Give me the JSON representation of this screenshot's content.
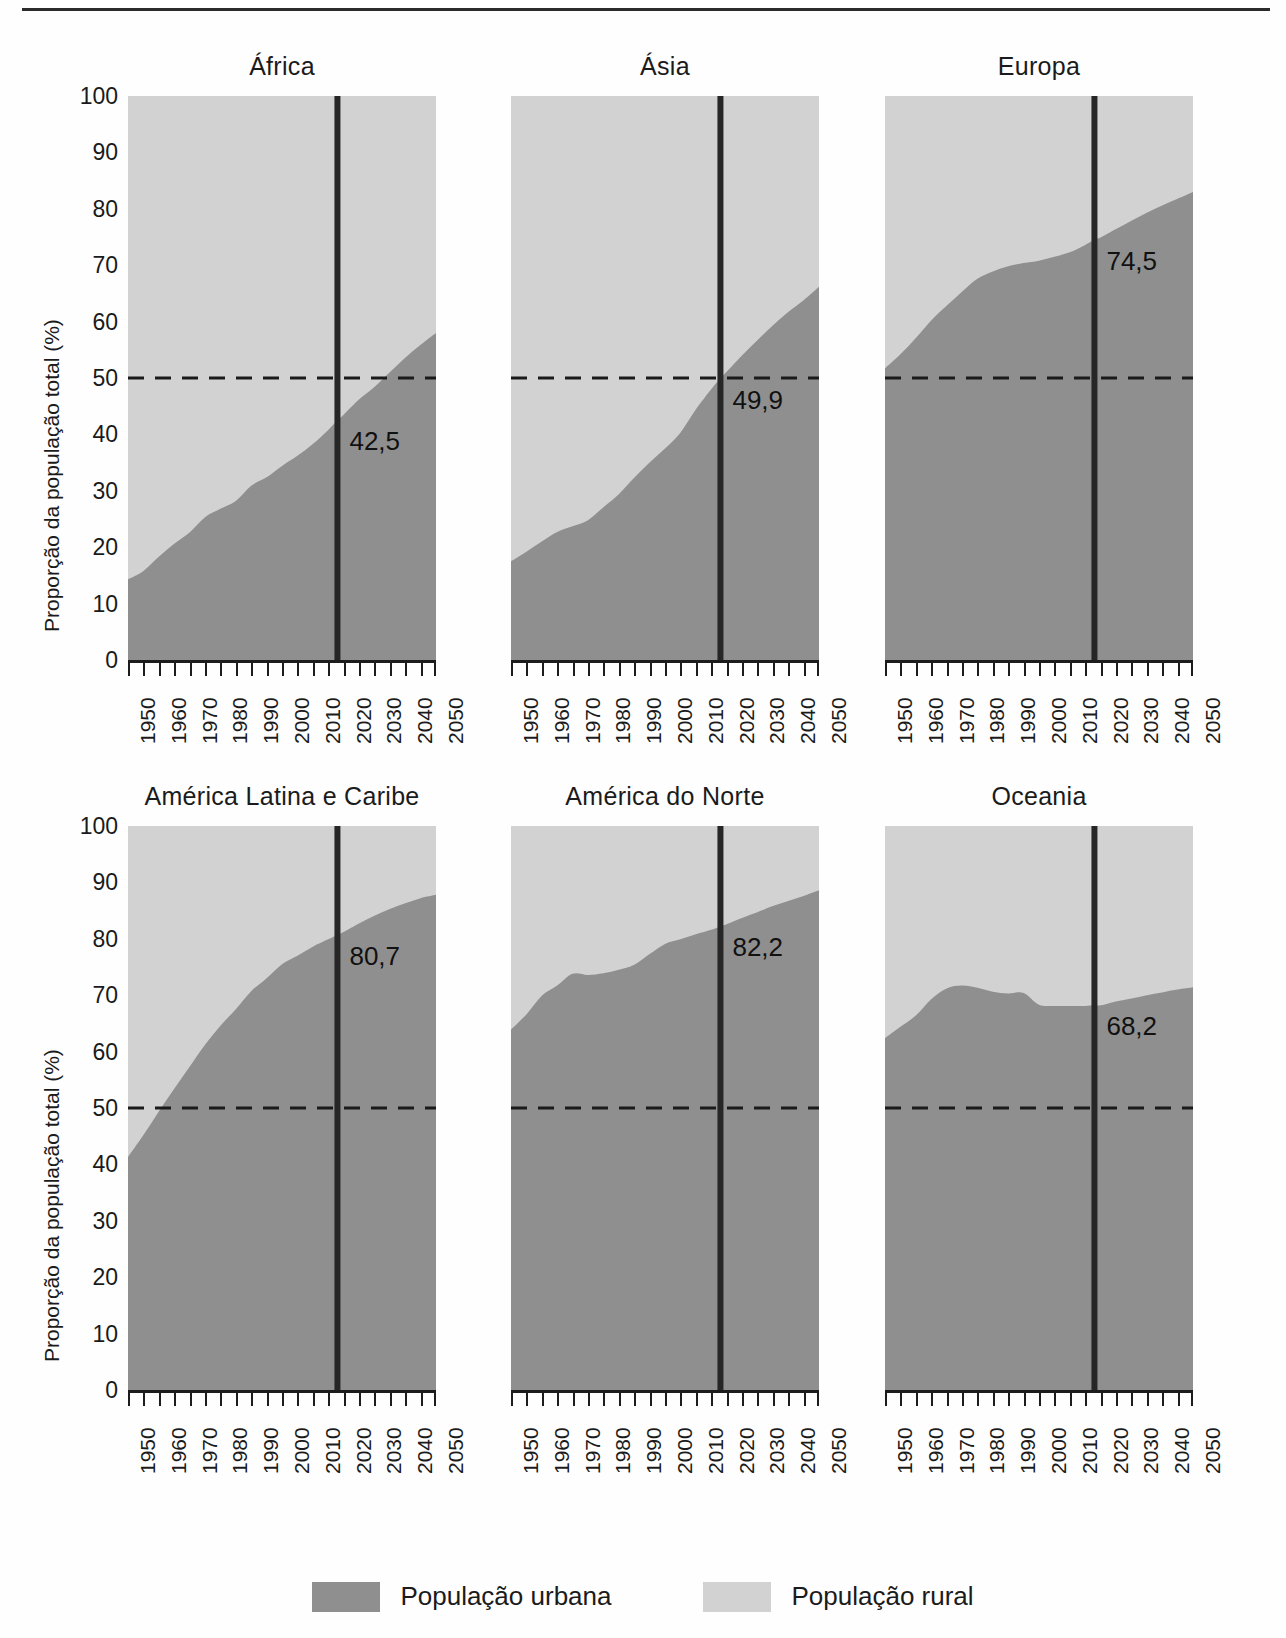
{
  "colors": {
    "urban": "#8f8f8f",
    "rural": "#d2d2d2",
    "axis": "#1c1c1c",
    "marker_line": "#262626",
    "dash_line": "#1a1a1a"
  },
  "axis": {
    "y_title": "Proporção da população total (%)",
    "y_ticks": [
      "100",
      "90",
      "80",
      "70",
      "60",
      "50",
      "40",
      "30",
      "20",
      "10",
      "0"
    ],
    "y_min": 0,
    "y_max": 100,
    "x_ticks": [
      "1950",
      "1960",
      "1970",
      "1980",
      "1990",
      "2000",
      "2010",
      "2020",
      "2030",
      "2040",
      "2050"
    ],
    "x_min": 1950,
    "x_max": 2050,
    "reference_line_value": "50",
    "marker_year": "2018"
  },
  "legend": {
    "position": "bottom-center",
    "items": [
      {
        "label": "População urbana",
        "key": "urban"
      },
      {
        "label": "População rural",
        "key": "rural"
      }
    ]
  },
  "chart_data": {
    "type": "area",
    "title": "",
    "subtitle": "",
    "xlabel": "",
    "ylabel": "Proporção da população total (%)",
    "xlim": [
      1950,
      2050
    ],
    "ylim": [
      0,
      100
    ],
    "grid": false,
    "stacked": true,
    "annotations": {
      "reference_line": 50,
      "marker_year": 2018
    },
    "x": [
      1950,
      1955,
      1960,
      1965,
      1970,
      1975,
      1980,
      1985,
      1990,
      1995,
      2000,
      2005,
      2010,
      2015,
      2018,
      2020,
      2025,
      2030,
      2035,
      2040,
      2045,
      2050
    ],
    "panels": [
      {
        "name": "África",
        "label_value": "42,5",
        "series": [
          {
            "name": "População urbana",
            "values": [
              14.3,
              15.8,
              18.3,
              20.6,
              22.6,
              25.3,
              26.8,
              28.2,
              30.9,
              32.4,
              34.4,
              36.2,
              38.3,
              40.8,
              42.5,
              43.5,
              46.2,
              48.4,
              51.0,
              53.6,
              55.9,
              58.0
            ]
          },
          {
            "name": "População rural",
            "values": [
              85.7,
              84.2,
              81.7,
              79.4,
              77.4,
              74.7,
              73.2,
              71.8,
              69.1,
              67.6,
              65.6,
              63.8,
              61.7,
              59.2,
              57.5,
              56.5,
              53.8,
              51.6,
              49.0,
              46.4,
              44.1,
              42.0
            ]
          }
        ]
      },
      {
        "name": "Ásia",
        "label_value": "49,9",
        "series": [
          {
            "name": "População urbana",
            "values": [
              17.5,
              19.2,
              21.0,
              22.7,
              23.7,
              24.8,
              27.1,
              29.4,
              32.3,
              35.0,
              37.5,
              40.3,
              44.4,
              48.0,
              49.9,
              51.1,
              54.0,
              56.7,
              59.3,
              61.7,
              63.8,
              66.2
            ]
          },
          {
            "name": "População rural",
            "values": [
              82.5,
              80.8,
              79.0,
              77.3,
              76.3,
              75.2,
              72.9,
              70.6,
              67.7,
              65.0,
              62.5,
              59.7,
              55.6,
              52.0,
              50.1,
              48.9,
              46.0,
              43.3,
              40.7,
              38.3,
              36.2,
              33.8
            ]
          }
        ]
      },
      {
        "name": "Europa",
        "label_value": "74,5",
        "series": [
          {
            "name": "População urbana",
            "values": [
              51.7,
              54.2,
              57.1,
              60.2,
              62.8,
              65.3,
              67.6,
              68.9,
              69.8,
              70.4,
              70.8,
              71.5,
              72.3,
              73.6,
              74.5,
              74.9,
              76.4,
              77.9,
              79.3,
              80.6,
              81.8,
              83.0
            ]
          },
          {
            "name": "População rural",
            "values": [
              48.3,
              45.8,
              42.9,
              39.8,
              37.2,
              34.7,
              32.4,
              31.1,
              30.2,
              29.6,
              29.2,
              28.5,
              27.7,
              26.4,
              25.5,
              25.1,
              23.6,
              22.1,
              20.7,
              19.4,
              18.2,
              17.0
            ]
          }
        ]
      },
      {
        "name": "América Latina e Caribe",
        "label_value": "80,7",
        "series": [
          {
            "name": "População urbana",
            "values": [
              41.3,
              45.2,
              49.4,
              53.4,
              57.3,
              61.2,
              64.6,
              67.5,
              70.7,
              73.0,
              75.5,
              77.0,
              78.6,
              79.9,
              80.7,
              81.2,
              82.7,
              84.1,
              85.3,
              86.3,
              87.2,
              87.8
            ]
          },
          {
            "name": "População rural",
            "values": [
              58.7,
              54.8,
              50.6,
              46.6,
              42.7,
              38.8,
              35.4,
              32.5,
              29.3,
              27.0,
              24.5,
              23.0,
              21.4,
              20.1,
              19.3,
              18.8,
              17.3,
              15.9,
              14.7,
              13.7,
              12.8,
              12.2
            ]
          }
        ]
      },
      {
        "name": "América do Norte",
        "label_value": "82,2",
        "series": [
          {
            "name": "População urbana",
            "values": [
              63.9,
              66.6,
              69.9,
              71.7,
              73.8,
              73.6,
              73.9,
              74.5,
              75.4,
              77.3,
              79.1,
              79.9,
              80.8,
              81.6,
              82.2,
              82.6,
              83.7,
              84.7,
              85.8,
              86.7,
              87.6,
              88.6
            ]
          },
          {
            "name": "População rural",
            "values": [
              36.1,
              33.4,
              30.1,
              28.3,
              26.2,
              26.4,
              26.1,
              25.5,
              24.6,
              22.7,
              20.9,
              20.1,
              19.2,
              18.4,
              17.8,
              17.4,
              16.3,
              15.3,
              14.2,
              13.3,
              12.4,
              11.4
            ]
          }
        ]
      },
      {
        "name": "Oceania",
        "label_value": "68,2",
        "series": [
          {
            "name": "População urbana",
            "values": [
              62.4,
              64.4,
              66.4,
              69.3,
              71.2,
              71.7,
              71.3,
              70.6,
              70.3,
              70.4,
              68.3,
              68.1,
              68.1,
              68.1,
              68.2,
              68.2,
              68.9,
              69.4,
              70.0,
              70.5,
              71.0,
              71.4
            ]
          },
          {
            "name": "População rural",
            "values": [
              37.6,
              35.6,
              33.6,
              30.7,
              28.8,
              28.3,
              28.7,
              29.4,
              29.7,
              29.6,
              31.7,
              31.9,
              31.9,
              31.9,
              31.8,
              31.8,
              31.1,
              30.6,
              30.0,
              29.5,
              29.0,
              28.6
            ]
          }
        ]
      }
    ]
  }
}
